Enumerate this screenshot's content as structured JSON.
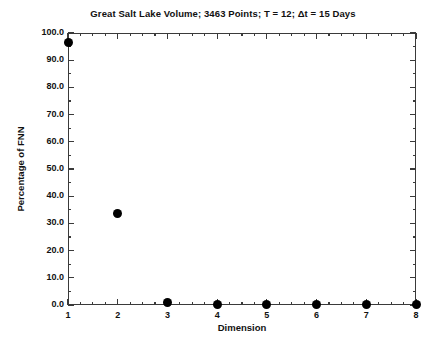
{
  "chart_data": {
    "type": "scatter",
    "title": "Great Salt Lake Volume; 3463 Points; T = 12; Δt = 15 Days",
    "xlabel": "Dimension",
    "ylabel": "Percentage of FNN",
    "x": [
      1,
      2,
      3,
      4,
      5,
      6,
      7,
      8
    ],
    "values": [
      96.5,
      33.5,
      1.0,
      0.2,
      0.1,
      0.05,
      0.05,
      0.05
    ],
    "categories": [
      "1",
      "2",
      "3",
      "4",
      "5",
      "6",
      "7",
      "8"
    ],
    "xlim": [
      1,
      8
    ],
    "ylim": [
      0.0,
      100.0
    ],
    "x_tick_labels": [
      "1",
      "2",
      "3",
      "4",
      "5",
      "6",
      "7",
      "8"
    ],
    "y_tick_labels": [
      "0.0",
      "10.0",
      "20.0",
      "30.0",
      "40.0",
      "50.0",
      "60.0",
      "70.0",
      "80.0",
      "90.0",
      "100.0"
    ],
    "y_tick_values": [
      0,
      10,
      20,
      30,
      40,
      50,
      60,
      70,
      80,
      90,
      100
    ],
    "y_minor_step": 5,
    "x_minor_step": 0.25,
    "grid": false,
    "legend": null,
    "marker_color": "#000000",
    "marker_shape": "filled-circle",
    "frame_color": "#3a3a3a",
    "background": "#ffffff",
    "series": [
      {
        "name": "Percentage of FNN",
        "values": [
          96.5,
          33.5,
          1.0,
          0.2,
          0.1,
          0.05,
          0.05,
          0.05
        ]
      }
    ]
  }
}
